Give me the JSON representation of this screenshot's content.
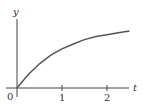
{
  "chart_data": {
    "type": "line",
    "title": "",
    "xlabel": "t",
    "ylabel": "y",
    "x_ticks": [
      "0",
      "1",
      "2"
    ],
    "origin_label": "0",
    "series": [
      {
        "name": "y(t)",
        "description": "increasing concave curve starting at origin, approaching horizontal asymptote",
        "x": [
          0,
          0.25,
          0.5,
          0.75,
          1.0,
          1.25,
          1.5,
          1.75,
          2.0,
          2.25,
          2.5
        ],
        "values": [
          0,
          0.22,
          0.39,
          0.53,
          0.63,
          0.71,
          0.78,
          0.83,
          0.86,
          0.89,
          0.92
        ]
      }
    ],
    "xlim": [
      0,
      2.5
    ],
    "grid": false,
    "legend": "none"
  },
  "axes": {
    "x_label": "t",
    "y_label": "y",
    "origin": "0",
    "tick_1": "1",
    "tick_2": "2"
  }
}
